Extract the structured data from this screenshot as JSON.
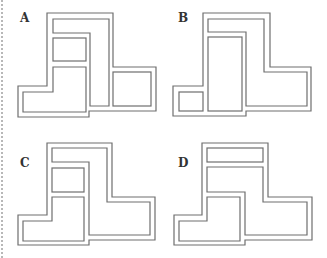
{
  "figures": [
    {
      "label": "A",
      "label_pos": [
        20,
        22
      ]
    },
    {
      "label": "B",
      "label_pos": [
        178,
        22
      ]
    },
    {
      "label": "C",
      "label_pos": [
        20,
        167
      ]
    },
    {
      "label": "D",
      "label_pos": [
        178,
        167
      ]
    }
  ],
  "colors": {
    "wall": "#6e6e6e",
    "label": "#333333",
    "background": "#ffffff"
  }
}
